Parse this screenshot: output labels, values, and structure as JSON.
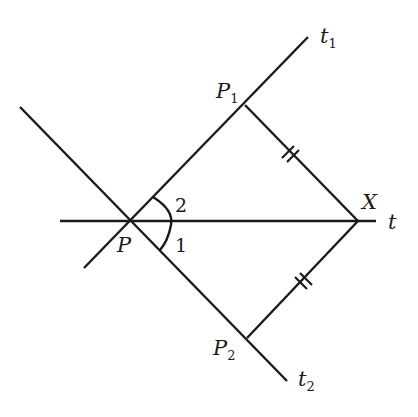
{
  "diagram": {
    "type": "geometry",
    "points": {
      "P": {
        "label": "P",
        "x": 130,
        "y": 221
      },
      "P1": {
        "label": "P",
        "sub": "1",
        "x": 245,
        "y": 105
      },
      "P2": {
        "label": "P",
        "sub": "2",
        "x": 247,
        "y": 338
      },
      "X": {
        "label": "X",
        "x": 358,
        "y": 221
      }
    },
    "lines": {
      "t": {
        "label": "t"
      },
      "t1": {
        "label": "t",
        "sub": "1"
      },
      "t2": {
        "label": "t",
        "sub": "2"
      }
    },
    "angles": {
      "angle1": {
        "label": "1"
      },
      "angle2": {
        "label": "2"
      }
    },
    "congruent_segments": [
      "P1X",
      "P2X"
    ]
  }
}
